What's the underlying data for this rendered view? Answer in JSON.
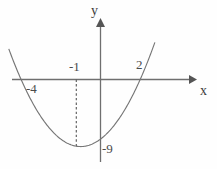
{
  "figure": {
    "title": "",
    "background_color": "#fefefe",
    "curve_color": "#767676",
    "axis_color": "#6f6f6f",
    "text_color": "#4a4a4a"
  },
  "axes": {
    "x_axis_label": "x",
    "y_axis_label": "y",
    "x_axis_name": "x-axis",
    "y_axis_name": "y-axis",
    "grid": false,
    "arrow_x": "right",
    "arrow_y": "up"
  },
  "labels": {
    "root_left": "-4",
    "vertex_x": "-1",
    "root_right": "2",
    "vertex_y": "-9"
  },
  "icons": {
    "x_arrow": "arrow-right-icon",
    "y_arrow": "arrow-up-icon"
  },
  "chart_data": {
    "type": "line",
    "title": "",
    "xlabel": "x",
    "ylabel": "y",
    "grid": false,
    "legend": "none",
    "xlim": [
      -4.9,
      2.9
    ],
    "ylim": [
      -10.5,
      10.5
    ],
    "curve": {
      "name": "parabola",
      "equation": "y = x^2 + 2x - 8",
      "factored": "y = (x + 4)(x - 2)",
      "roots": [
        -4,
        2
      ],
      "vertex": [
        -1,
        -9
      ],
      "opens": "up",
      "x": [
        -4.6,
        -4.4,
        -4.2,
        -4.0,
        -3.8,
        -3.6,
        -3.4,
        -3.2,
        -3.0,
        -2.8,
        -2.6,
        -2.4,
        -2.2,
        -2.0,
        -1.8,
        -1.6,
        -1.4,
        -1.2,
        -1.0,
        -0.8,
        -0.6,
        -0.4,
        -0.2,
        0.0,
        0.2,
        0.4,
        0.6,
        0.8,
        1.0,
        1.2,
        1.4,
        1.6,
        1.8,
        2.0,
        2.2,
        2.4,
        2.6,
        2.8
      ],
      "y": [
        2.36,
        0.56,
        -1.16,
        -8.0,
        -0.76,
        -2.24,
        -3.24,
        -4.16,
        -5.0,
        -5.76,
        -6.44,
        -7.04,
        -7.56,
        -8.0,
        -8.36,
        -8.64,
        -8.84,
        -8.96,
        -9.0,
        -8.96,
        -8.84,
        -8.64,
        -8.36,
        -8.0,
        -7.56,
        -7.04,
        -6.44,
        -5.76,
        -5.0,
        -4.16,
        -3.24,
        -2.24,
        -1.16,
        0.0,
        1.24,
        2.56,
        3.96,
        5.44
      ]
    },
    "annotations": [
      {
        "text": "-4",
        "at": [
          -4,
          0
        ],
        "placement": "below-left",
        "name": "root-left-label"
      },
      {
        "text": "2",
        "at": [
          2,
          0
        ],
        "placement": "above-left",
        "name": "root-right-label"
      },
      {
        "text": "-1",
        "at": [
          -1,
          0
        ],
        "placement": "above",
        "name": "vertex-x-label"
      },
      {
        "text": "-9",
        "at": [
          0,
          -9
        ],
        "placement": "right",
        "name": "vertex-y-label"
      }
    ],
    "dashed_guide": {
      "from": [
        -1,
        0
      ],
      "to": [
        -1,
        -9
      ],
      "style": "dashed",
      "name": "vertex-drop-line"
    }
  }
}
